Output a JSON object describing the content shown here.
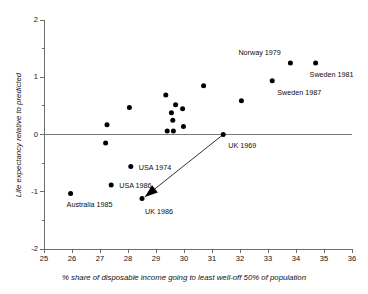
{
  "chart_data": {
    "type": "scatter",
    "title": "",
    "xlabel": "% share of disposable income going to least well-off 50% of population",
    "ylabel": "Life expectancy relative to predicted",
    "xlim": [
      25,
      36
    ],
    "ylim": [
      -2,
      2
    ],
    "xticks": [
      "25",
      "26",
      "27",
      "28",
      "29",
      "30",
      "31",
      "32",
      "33",
      "34",
      "35",
      "36"
    ],
    "yticks": [
      "-2",
      "-1",
      "0",
      "1",
      "2"
    ],
    "yminor_step": 0.5,
    "grid": false,
    "legend": "none",
    "zero_reference_line": 0,
    "point_color": "#000000",
    "points": [
      {
        "x": 25.95,
        "y": -1.03,
        "label": "Australia 1985",
        "label_dx": -4,
        "label_dy": 12
      },
      {
        "x": 27.25,
        "y": 0.17,
        "label": "",
        "label_dx": 0,
        "label_dy": 0
      },
      {
        "x": 27.2,
        "y": -0.15,
        "label": "",
        "label_dx": 0,
        "label_dy": 0
      },
      {
        "x": 27.4,
        "y": -0.88,
        "label": "USA 1986",
        "label_dx": 8,
        "label_dy": 1
      },
      {
        "x": 28.05,
        "y": 0.47,
        "label": "",
        "label_dx": 0,
        "label_dy": 0
      },
      {
        "x": 28.1,
        "y": -0.56,
        "label": "USA 1974",
        "label_dx": 8,
        "label_dy": 1
      },
      {
        "x": 28.5,
        "y": -1.12,
        "label": "UK 1986",
        "label_dx": 3,
        "label_dy": 13
      },
      {
        "x": 29.35,
        "y": 0.69,
        "label": "",
        "label_dx": 0,
        "label_dy": 0
      },
      {
        "x": 29.4,
        "y": 0.06,
        "label": "",
        "label_dx": 0,
        "label_dy": 0
      },
      {
        "x": 29.55,
        "y": 0.38,
        "label": "",
        "label_dx": 0,
        "label_dy": 0
      },
      {
        "x": 29.6,
        "y": 0.25,
        "label": "",
        "label_dx": 0,
        "label_dy": 0
      },
      {
        "x": 29.62,
        "y": 0.06,
        "label": "",
        "label_dx": 0,
        "label_dy": 0
      },
      {
        "x": 29.7,
        "y": 0.52,
        "label": "",
        "label_dx": 0,
        "label_dy": 0
      },
      {
        "x": 29.95,
        "y": 0.45,
        "label": "",
        "label_dx": 0,
        "label_dy": 0
      },
      {
        "x": 29.98,
        "y": 0.14,
        "label": "",
        "label_dx": 0,
        "label_dy": 0
      },
      {
        "x": 30.7,
        "y": 0.85,
        "label": "",
        "label_dx": 0,
        "label_dy": 0
      },
      {
        "x": 31.4,
        "y": 0.0,
        "label": "UK 1969",
        "label_dx": 5,
        "label_dy": 11
      },
      {
        "x": 32.05,
        "y": 0.59,
        "label": "",
        "label_dx": 0,
        "label_dy": 0
      },
      {
        "x": 33.15,
        "y": 0.94,
        "label": "Sweden 1987",
        "label_dx": 5,
        "label_dy": 12
      },
      {
        "x": 33.8,
        "y": 1.25,
        "label": "Norway 1979",
        "label_dx": -52,
        "label_dy": -10
      },
      {
        "x": 34.7,
        "y": 1.25,
        "label": "Sweden 1981",
        "label_dx": -6,
        "label_dy": 12
      }
    ],
    "annotation_arrow": {
      "name": "uk-trend-arrow",
      "from": {
        "x": 31.4,
        "y": 0.0
      },
      "to": {
        "x": 28.6,
        "y": -1.09
      }
    }
  }
}
